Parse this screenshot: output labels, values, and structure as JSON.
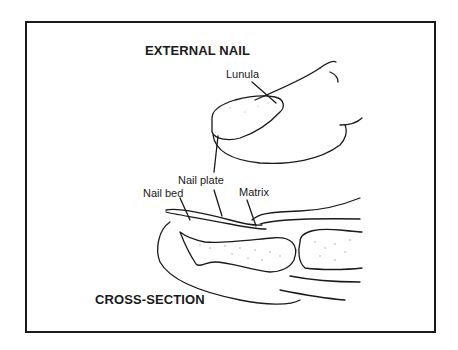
{
  "diagram": {
    "headings": {
      "external": "EXTERNAL NAIL",
      "cross_section": "CROSS-SECTION"
    },
    "labels": {
      "lunula": "Lunula",
      "nail_plate": "Nail plate",
      "nail_bed": "Nail bed",
      "matrix": "Matrix"
    },
    "colors": {
      "line": "#1a1a1a",
      "background": "#ffffff",
      "stipple": "#9a9a9a"
    }
  }
}
